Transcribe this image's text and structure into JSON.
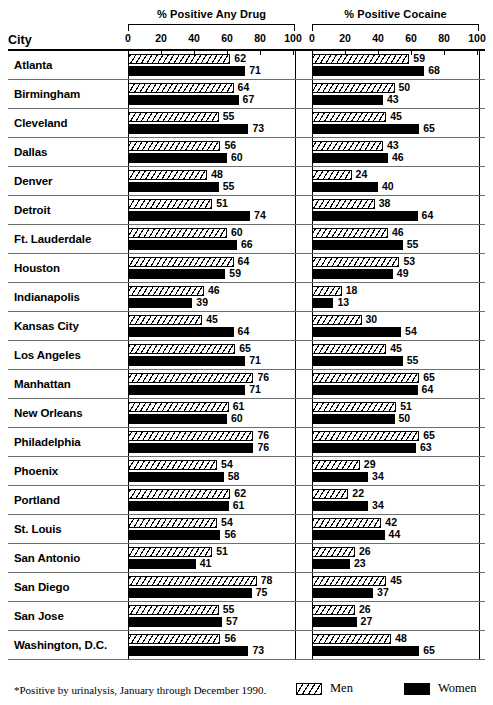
{
  "figure": {
    "city_column_header": "City",
    "footnote": "*Positive by urinalysis, January through December 1990."
  },
  "legend": {
    "men_label": "Men",
    "women_label": "Women",
    "men_color": "#ffffff",
    "women_color": "#000000"
  },
  "axis": {
    "ticks": [
      "0",
      "20",
      "40",
      "60",
      "80",
      "100"
    ],
    "min": 0,
    "max": 100
  },
  "chart_data": {
    "type": "bar",
    "title": "",
    "orientation": "horizontal",
    "grid": false,
    "legend_position": "bottom-right",
    "xlabel": "",
    "ylabel": "City",
    "xlim": [
      0,
      100
    ],
    "tick_values": [
      0,
      20,
      40,
      60,
      80,
      100
    ],
    "categories": [
      "Atlanta",
      "Birmingham",
      "Cleveland",
      "Dallas",
      "Denver",
      "Detroit",
      "Ft. Lauderdale",
      "Houston",
      "Indianapolis",
      "Kansas City",
      "Los Angeles",
      "Manhattan",
      "New Orleans",
      "Philadelphia",
      "Phoenix",
      "Portland",
      "St. Louis",
      "San Antonio",
      "San Diego",
      "San Jose",
      "Washington, D.C."
    ],
    "panels": [
      {
        "name": "any_drug",
        "title": "% Positive Any Drug",
        "series": [
          {
            "name": "Men",
            "values": [
              62,
              64,
              55,
              56,
              48,
              51,
              60,
              64,
              46,
              45,
              65,
              76,
              61,
              76,
              54,
              62,
              54,
              51,
              78,
              55,
              56
            ]
          },
          {
            "name": "Women",
            "values": [
              71,
              67,
              73,
              60,
              55,
              74,
              66,
              59,
              39,
              64,
              71,
              71,
              60,
              76,
              58,
              61,
              56,
              41,
              75,
              57,
              73
            ]
          }
        ]
      },
      {
        "name": "cocaine",
        "title": "% Positive Cocaine",
        "series": [
          {
            "name": "Men",
            "values": [
              59,
              50,
              45,
              43,
              24,
              38,
              46,
              53,
              18,
              30,
              45,
              65,
              51,
              65,
              29,
              22,
              42,
              26,
              45,
              26,
              48
            ]
          },
          {
            "name": "Women",
            "values": [
              68,
              43,
              65,
              46,
              40,
              64,
              55,
              49,
              13,
              54,
              55,
              64,
              50,
              63,
              34,
              34,
              44,
              23,
              37,
              27,
              65
            ]
          }
        ]
      }
    ]
  }
}
